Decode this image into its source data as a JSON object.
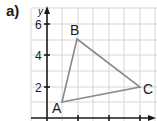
{
  "figure": {
    "part_label": "a)",
    "axis_y_label": "y",
    "y_ticks": [
      "6",
      "4",
      "2"
    ],
    "vertices": [
      {
        "name": "A",
        "x": 1,
        "y": 1
      },
      {
        "name": "B",
        "x": 2,
        "y": 5
      },
      {
        "name": "C",
        "x": 6,
        "y": 2
      }
    ],
    "colors": {
      "grid": "#d6d6d6",
      "axis": "#1a1a1a",
      "triangle": "#8a8a8a"
    }
  }
}
